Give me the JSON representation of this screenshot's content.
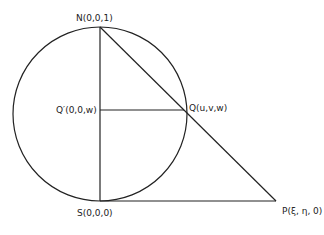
{
  "diagram": {
    "points": {
      "N": {
        "label": "N(0,0,1)"
      },
      "Qprime": {
        "label": "Q′(0,0,w)"
      },
      "Q": {
        "label": "Q(u,v,w)"
      },
      "S": {
        "label": "S(0,0,0)"
      },
      "P": {
        "label": "P(ξ, η, 0)"
      }
    },
    "edges": [
      {
        "from": "N",
        "to": "S",
        "desc": "vertical diameter"
      },
      {
        "from": "N",
        "to": "P",
        "desc": "projection line through Q"
      },
      {
        "from": "Qprime",
        "to": "Q",
        "desc": "horizontal segment"
      },
      {
        "from": "S",
        "to": "P",
        "desc": "plane line"
      }
    ],
    "shapes": [
      {
        "type": "circle",
        "desc": "sphere cross-section"
      }
    ],
    "colors": {
      "ink": "#222222",
      "background": "#ffffff"
    }
  }
}
